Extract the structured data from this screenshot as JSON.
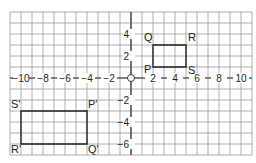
{
  "diagram": {
    "type": "coordinate-grid",
    "grid": {
      "x_min": -11,
      "x_max": 11,
      "y_min": -7,
      "y_max": 6,
      "origin_px": [
        131,
        78
      ],
      "unit_px": 11,
      "line_color": "#9a9a9a",
      "axis_color": "#333333"
    },
    "x_tick_labels": [
      {
        "value": -10,
        "label": "−10"
      },
      {
        "value": -8,
        "label": "−8"
      },
      {
        "value": -6,
        "label": "−6"
      },
      {
        "value": -4,
        "label": "−4"
      },
      {
        "value": -2,
        "label": "−2"
      },
      {
        "value": 2,
        "label": "2"
      },
      {
        "value": 4,
        "label": "4"
      },
      {
        "value": 6,
        "label": "6"
      },
      {
        "value": 8,
        "label": "8"
      },
      {
        "value": 10,
        "label": "10"
      }
    ],
    "y_tick_labels": [
      {
        "value": 4,
        "label": "4"
      },
      {
        "value": 2,
        "label": "2"
      },
      {
        "value": -2,
        "label": "−2"
      },
      {
        "value": -4,
        "label": "−4"
      },
      {
        "value": -6,
        "label": "−6"
      }
    ],
    "origin_label": "O",
    "shapes": [
      {
        "name": "PQRS",
        "vertices": [
          {
            "label": "P",
            "x": 2,
            "y": 1,
            "label_dx": -9,
            "label_dy": 6
          },
          {
            "label": "Q",
            "x": 2,
            "y": 3,
            "label_dx": -9,
            "label_dy": -4
          },
          {
            "label": "R",
            "x": 5,
            "y": 3,
            "label_dx": 2,
            "label_dy": -4
          },
          {
            "label": "S",
            "x": 5,
            "y": 1,
            "label_dx": 2,
            "label_dy": 7
          }
        ]
      },
      {
        "name": "P'Q'R'S'",
        "vertices": [
          {
            "label": "P'",
            "x": -4,
            "y": -3,
            "label_dx": 1,
            "label_dy": -3
          },
          {
            "label": "Q'",
            "x": -4,
            "y": -6,
            "label_dx": 1,
            "label_dy": 9
          },
          {
            "label": "R'",
            "x": -10,
            "y": -6,
            "label_dx": -10,
            "label_dy": 9
          },
          {
            "label": "S'",
            "x": -10,
            "y": -3,
            "label_dx": -10,
            "label_dy": -3
          }
        ]
      }
    ]
  }
}
